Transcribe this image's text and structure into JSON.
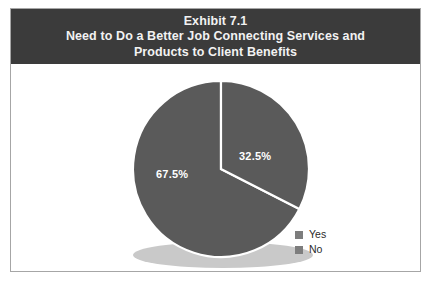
{
  "exhibit": {
    "title_lines": [
      "Exhibit 7.1",
      "Need to Do a Better Job Connecting Services and",
      "Products to Client Benefits"
    ],
    "banner_color": "#3b3b3b",
    "banner_text_color": "#f2f2f2",
    "frame_border_color": "#a6a6a6",
    "background_color": "#ffffff"
  },
  "chart_data": {
    "type": "pie",
    "title": "Need to Do a Better Job Connecting Services and Products to Client Benefits",
    "subtitle": "Exhibit 7.1",
    "categories": [
      "Yes",
      "No"
    ],
    "values": [
      32.5,
      67.5
    ],
    "value_labels": [
      "32.5%",
      "67.5%"
    ],
    "unit": "%",
    "slice_colors": [
      "#5a5a5a",
      "#5a5a5a"
    ],
    "slice_border_color": "#ffffff",
    "data_label_color": "#ffffff",
    "start_angle_deg": 0,
    "direction": "clockwise",
    "legend": {
      "position": "bottom-right",
      "entries": [
        {
          "label": "Yes",
          "swatch_color": "#7d7d7d"
        },
        {
          "label": "No",
          "swatch_color": "#7d7d7d"
        }
      ]
    },
    "shadow": {
      "visible": true,
      "color": "#c9c9c9"
    },
    "grid": false,
    "xlabel": "",
    "ylabel": ""
  }
}
